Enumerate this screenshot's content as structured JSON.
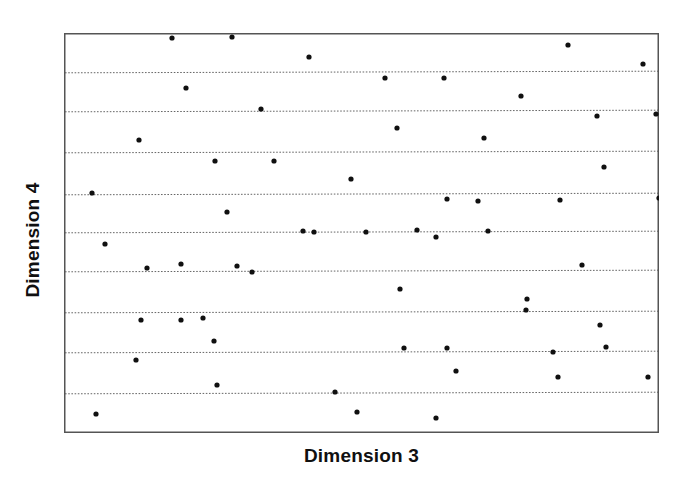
{
  "figure": {
    "background_color": "#ffffff",
    "ink_color": "#101010"
  },
  "axes": {
    "xlabel": "Dimension 3",
    "ylabel": "Dimension 4",
    "frame": {
      "left": 64,
      "top": 33,
      "width": 595,
      "height": 400
    },
    "frame_color": "#555555",
    "grid_color": "#666666",
    "x_tick_labels": [],
    "y_tick_labels": []
  },
  "chart_data": {
    "type": "scatter",
    "title": "",
    "xlabel": "Dimension 3",
    "ylabel": "Dimension 4",
    "xlim": [
      0,
      100
    ],
    "ylim": [
      0,
      100
    ],
    "grid": true,
    "grid_orientation": "horizontal",
    "grid_style": "dotted",
    "legend": null,
    "marker": {
      "shape": "circle",
      "color": "#101010",
      "size_px": 4
    },
    "n_points": 60,
    "gridlines_y_px": [
      72,
      111,
      152,
      194,
      232,
      271,
      312,
      352,
      393
    ],
    "points_px": [
      [
        172,
        38
      ],
      [
        232,
        37
      ],
      [
        309,
        57
      ],
      [
        568,
        45
      ],
      [
        643,
        64
      ],
      [
        186,
        88
      ],
      [
        385,
        78
      ],
      [
        444,
        78
      ],
      [
        261,
        109
      ],
      [
        521,
        96
      ],
      [
        139,
        140
      ],
      [
        597,
        116
      ],
      [
        656,
        114
      ],
      [
        397,
        128
      ],
      [
        215,
        161
      ],
      [
        274,
        161
      ],
      [
        351,
        179
      ],
      [
        92,
        193
      ],
      [
        484,
        138
      ],
      [
        227,
        212
      ],
      [
        478,
        201
      ],
      [
        604,
        167
      ],
      [
        303,
        231
      ],
      [
        105,
        244
      ],
      [
        181,
        264
      ],
      [
        447,
        199
      ],
      [
        560,
        200
      ],
      [
        659,
        198
      ],
      [
        488,
        231
      ],
      [
        181,
        320
      ],
      [
        417,
        230
      ],
      [
        314,
        232
      ],
      [
        366,
        232
      ],
      [
        237,
        266
      ],
      [
        436,
        237
      ],
      [
        147,
        268
      ],
      [
        582,
        265
      ],
      [
        663,
        246
      ],
      [
        252,
        272
      ],
      [
        665,
        289
      ],
      [
        400,
        289
      ],
      [
        527,
        299
      ],
      [
        141,
        320
      ],
      [
        203,
        318
      ],
      [
        526,
        310
      ],
      [
        600,
        325
      ],
      [
        663,
        313
      ],
      [
        214,
        341
      ],
      [
        606,
        347
      ],
      [
        404,
        348
      ],
      [
        447,
        348
      ],
      [
        136,
        360
      ],
      [
        553,
        352
      ],
      [
        217,
        385
      ],
      [
        456,
        371
      ],
      [
        558,
        377
      ],
      [
        648,
        377
      ],
      [
        335,
        392
      ],
      [
        96,
        414
      ],
      [
        357,
        412
      ],
      [
        436,
        418
      ]
    ]
  }
}
